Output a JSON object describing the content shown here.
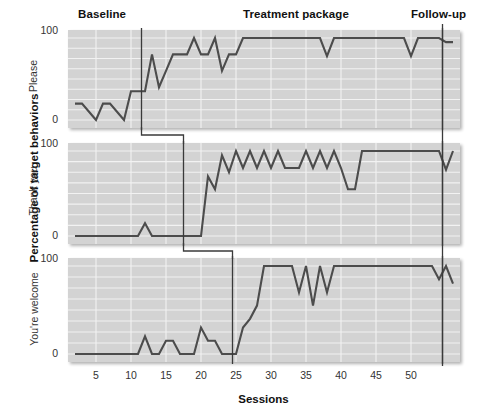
{
  "figure": {
    "axis_title_y": "Percentage of target behaviors",
    "axis_title_x": "Sessions",
    "phases": [
      {
        "id": "baseline",
        "label": "Baseline"
      },
      {
        "id": "treatment",
        "label": "Treatment package"
      },
      {
        "id": "followup",
        "label": "Follow-up"
      }
    ],
    "y_ticks": [
      "100",
      "0"
    ],
    "x_ticks": [
      "5",
      "10",
      "15",
      "20",
      "25",
      "30",
      "35",
      "40",
      "45",
      "50"
    ],
    "panel_labels": [
      "Please",
      "Thank you",
      "You're welcome"
    ],
    "colors": {
      "plot_background": "#d3d3d3",
      "gridline": "#f2f2f2",
      "data_line": "#4c4c4c",
      "phase_line": "#3a3a3a",
      "text": "#111111"
    }
  },
  "chart_data": {
    "type": "line",
    "title": "",
    "subtitle": "",
    "xlabel": "Sessions",
    "ylabel": "Percentage of target behaviors",
    "xlim": [
      1,
      57
    ],
    "ylim": [
      0,
      100
    ],
    "grid": true,
    "legend": false,
    "design": "multiple-baseline across behaviors",
    "x_ticks": [
      5,
      10,
      15,
      20,
      25,
      30,
      35,
      40,
      45,
      50
    ],
    "y_ticks": [
      0,
      100
    ],
    "annotations": [
      {
        "text": "Baseline",
        "x": 7
      },
      {
        "text": "Treatment package",
        "x": 32
      },
      {
        "text": "Follow-up",
        "x": 54
      }
    ],
    "panels": [
      {
        "name": "Please",
        "ylabel": "Please",
        "phase_lines": [
          11.5,
          54.5
        ],
        "x": [
          2,
          3,
          4,
          5,
          6,
          7,
          8,
          9,
          10,
          11,
          12,
          13,
          14,
          15,
          16,
          17,
          18,
          19,
          20,
          21,
          22,
          23,
          24,
          25,
          26,
          27,
          28,
          29,
          30,
          31,
          32,
          33,
          34,
          35,
          36,
          37,
          38,
          39,
          40,
          41,
          42,
          43,
          44,
          45,
          46,
          47,
          48,
          49,
          50,
          51,
          52,
          53,
          54,
          55,
          56
        ],
        "y": [
          20,
          20,
          10,
          0,
          20,
          20,
          10,
          0,
          35,
          35,
          35,
          80,
          40,
          60,
          80,
          80,
          80,
          100,
          80,
          80,
          100,
          60,
          80,
          80,
          100,
          100,
          100,
          100,
          100,
          100,
          100,
          100,
          100,
          100,
          100,
          100,
          78,
          100,
          100,
          100,
          100,
          100,
          100,
          100,
          100,
          100,
          100,
          100,
          78,
          100,
          100,
          100,
          100,
          95,
          95
        ]
      },
      {
        "name": "Thank you",
        "ylabel": "Thank you",
        "phase_lines": [
          17.5,
          54.5
        ],
        "x": [
          2,
          3,
          4,
          5,
          6,
          7,
          8,
          9,
          10,
          11,
          12,
          13,
          14,
          15,
          16,
          17,
          18,
          19,
          20,
          21,
          22,
          23,
          24,
          25,
          26,
          27,
          28,
          29,
          30,
          31,
          32,
          33,
          34,
          35,
          36,
          37,
          38,
          39,
          40,
          41,
          42,
          43,
          44,
          45,
          46,
          47,
          48,
          49,
          50,
          51,
          52,
          53,
          54,
          55,
          56
        ],
        "y": [
          0,
          0,
          0,
          0,
          0,
          0,
          0,
          0,
          0,
          0,
          15,
          0,
          0,
          0,
          0,
          0,
          0,
          0,
          0,
          70,
          55,
          95,
          75,
          100,
          80,
          100,
          80,
          100,
          80,
          100,
          80,
          80,
          80,
          100,
          80,
          100,
          80,
          100,
          80,
          55,
          55,
          100,
          100,
          100,
          100,
          100,
          100,
          100,
          100,
          100,
          100,
          100,
          100,
          78,
          100
        ]
      },
      {
        "name": "You're welcome",
        "ylabel": "You're welcome",
        "phase_lines": [
          24.5,
          54.5
        ],
        "x": [
          2,
          3,
          4,
          5,
          6,
          7,
          8,
          9,
          10,
          11,
          12,
          13,
          14,
          15,
          16,
          17,
          18,
          19,
          20,
          21,
          22,
          23,
          24,
          25,
          26,
          27,
          28,
          29,
          30,
          31,
          32,
          33,
          34,
          35,
          36,
          37,
          38,
          39,
          40,
          41,
          42,
          43,
          44,
          45,
          46,
          47,
          48,
          49,
          50,
          51,
          52,
          53,
          54,
          55,
          56
        ],
        "y": [
          0,
          0,
          0,
          0,
          0,
          0,
          0,
          0,
          0,
          0,
          20,
          0,
          0,
          15,
          15,
          0,
          0,
          0,
          30,
          15,
          15,
          0,
          0,
          0,
          30,
          40,
          55,
          100,
          100,
          100,
          100,
          100,
          70,
          100,
          55,
          100,
          70,
          100,
          100,
          100,
          100,
          100,
          100,
          100,
          100,
          100,
          100,
          100,
          100,
          100,
          100,
          100,
          85,
          100,
          80
        ]
      }
    ]
  }
}
